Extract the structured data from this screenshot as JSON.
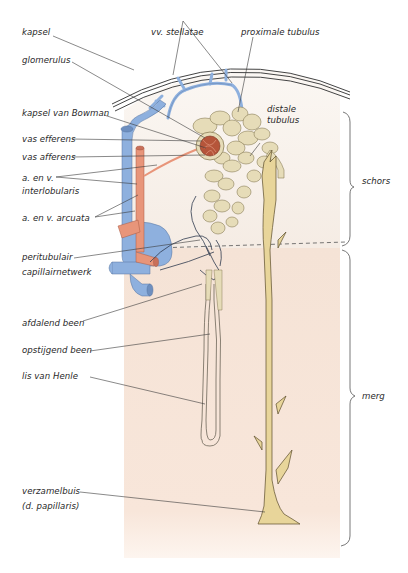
{
  "figure": {
    "type": "anatomical-diagram",
    "colors": {
      "background": "#ffffff",
      "cortex_tint": "#f6eee6",
      "medulla_tint": "#f6e2d4",
      "vein_blue": "#8eb0de",
      "artery_red": "#e8957a",
      "tubule_cream": "#e6dcb8",
      "collecting_duct_yellow": "#e8d59a",
      "glomerulus": "#b5553a",
      "line": "#3a3a3a"
    }
  },
  "labels": {
    "kapsel": "kapsel",
    "glomerulus": "glomerulus",
    "kapsel_van_bowman": "kapsel van Bowman",
    "vas_efferens": "vas efferens",
    "vas_afferens": "vas afferens",
    "interlobularis_line1": "a. en v.",
    "interlobularis_line2": "interlobularis",
    "arcuata": "a. en v. arcuata",
    "peritubulair_line1": "peritubulair",
    "peritubulair_line2": "capillairnetwerk",
    "afdalend_been": "afdalend been",
    "opstijgend_been": "opstijgend been",
    "lis_van_henle": "lis van Henle",
    "verzamelbuis_line1": "verzamelbuis",
    "verzamelbuis_line2": "(d. papillaris)",
    "vv_stellatae": "vv. stellatae",
    "proximale_tubulus": "proximale tubulus",
    "distale_line1": "distale",
    "distale_line2": "tubulus",
    "schors": "schors",
    "merg": "merg"
  }
}
